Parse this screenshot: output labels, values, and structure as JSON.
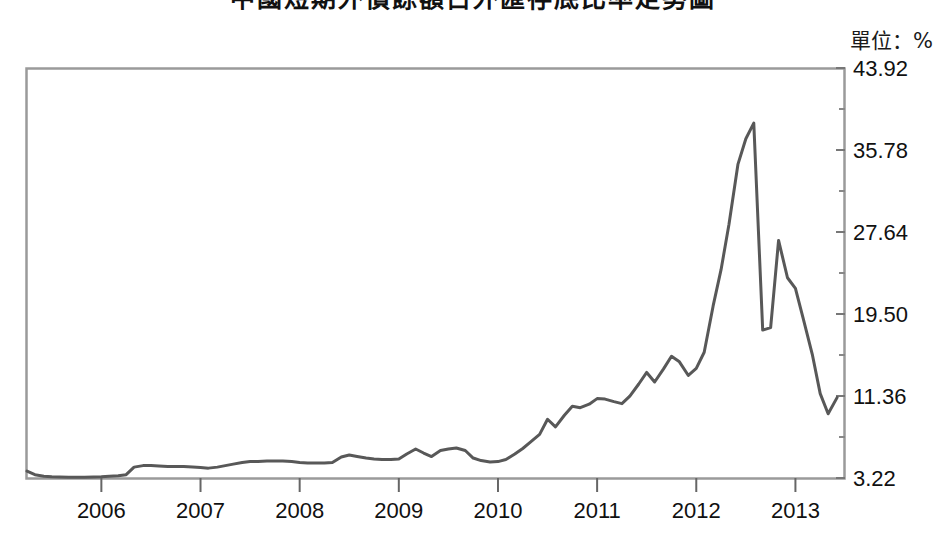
{
  "figure": {
    "title": "中國短期外債餘額占外匯存底比率走勢圖",
    "unit_label": "單位：%"
  },
  "chart_data": {
    "type": "line",
    "title": "中國短期外債餘額占外匯存底比率走勢圖",
    "subtitle": "",
    "xlabel": "",
    "ylabel": "",
    "unit": "%",
    "legend": [],
    "legend_position": "none",
    "grid": false,
    "line_color": "#585858",
    "line_width": 3,
    "xlim": [
      2005.25,
      2013.5
    ],
    "ylim": [
      3.22,
      43.92
    ],
    "yticks": [
      3.22,
      11.36,
      19.5,
      27.64,
      35.78,
      43.92
    ],
    "ytick_labels": [
      "3.22",
      "11.36",
      "19.50",
      "27.64",
      "35.78",
      "43.92"
    ],
    "minor_yticks": true,
    "xticks": [
      2006,
      2007,
      2008,
      2009,
      2010,
      2011,
      2012,
      2013
    ],
    "xtick_labels": [
      "2006",
      "2007",
      "2008",
      "2009",
      "2010",
      "2011",
      "2012",
      "2013"
    ],
    "series": [
      {
        "name": "短期外債餘額占外匯存底比率",
        "x": [
          2005.25,
          2005.33,
          2005.42,
          2005.5,
          2005.58,
          2005.67,
          2005.75,
          2005.83,
          2005.92,
          2006.0,
          2006.08,
          2006.17,
          2006.25,
          2006.33,
          2006.42,
          2006.5,
          2006.58,
          2006.67,
          2006.75,
          2006.83,
          2006.92,
          2007.0,
          2007.08,
          2007.17,
          2007.25,
          2007.33,
          2007.42,
          2007.5,
          2007.58,
          2007.67,
          2007.75,
          2007.83,
          2007.92,
          2008.0,
          2008.08,
          2008.17,
          2008.25,
          2008.33,
          2008.42,
          2008.5,
          2008.58,
          2008.67,
          2008.75,
          2008.83,
          2008.92,
          2009.0,
          2009.08,
          2009.17,
          2009.25,
          2009.33,
          2009.42,
          2009.5,
          2009.58,
          2009.67,
          2009.75,
          2009.83,
          2009.92,
          2010.0,
          2010.08,
          2010.17,
          2010.25,
          2010.33,
          2010.42,
          2010.5,
          2010.58,
          2010.67,
          2010.75,
          2010.83,
          2010.92,
          2011.0,
          2011.08,
          2011.17,
          2011.25,
          2011.33,
          2011.42,
          2011.5,
          2011.58,
          2011.67,
          2011.75,
          2011.83,
          2011.92,
          2012.0,
          2012.08,
          2012.17,
          2012.25,
          2012.33,
          2012.42,
          2012.5,
          2012.58,
          2012.67,
          2012.75,
          2012.83,
          2012.92,
          2013.0,
          2013.08,
          2013.17,
          2013.25,
          2013.33,
          2013.42
        ],
        "y": [
          3.9,
          3.55,
          3.4,
          3.35,
          3.32,
          3.3,
          3.3,
          3.3,
          3.32,
          3.35,
          3.4,
          3.45,
          3.55,
          4.3,
          4.45,
          4.45,
          4.4,
          4.35,
          4.35,
          4.35,
          4.3,
          4.25,
          4.2,
          4.3,
          4.45,
          4.6,
          4.75,
          4.85,
          4.85,
          4.9,
          4.9,
          4.9,
          4.85,
          4.75,
          4.7,
          4.7,
          4.7,
          4.75,
          5.3,
          5.5,
          5.35,
          5.2,
          5.1,
          5.05,
          5.05,
          5.1,
          5.6,
          6.1,
          5.7,
          5.35,
          5.95,
          6.1,
          6.2,
          5.95,
          5.2,
          4.95,
          4.8,
          4.85,
          5.05,
          5.6,
          6.15,
          6.8,
          7.55,
          9.05,
          8.3,
          9.45,
          10.35,
          10.2,
          10.55,
          11.1,
          11.05,
          10.8,
          10.6,
          11.35,
          12.55,
          13.7,
          12.75,
          14.05,
          15.3,
          14.75,
          13.4,
          14.1,
          15.7,
          20.3,
          23.9,
          28.4,
          34.35,
          36.9,
          38.45,
          17.9,
          18.15,
          26.8,
          23.1,
          22.05,
          19.0,
          15.5,
          11.6,
          9.6,
          11.2
        ]
      }
    ],
    "annotations": [],
    "notable_points": {
      "peak_value": 38.45,
      "peak_date": "2012.08",
      "secondary_peak_value": 26.8,
      "secondary_peak_date": "2012.83",
      "series_start_value": 3.9,
      "series_end_value": 11.2,
      "minimum_value": 3.3
    }
  }
}
